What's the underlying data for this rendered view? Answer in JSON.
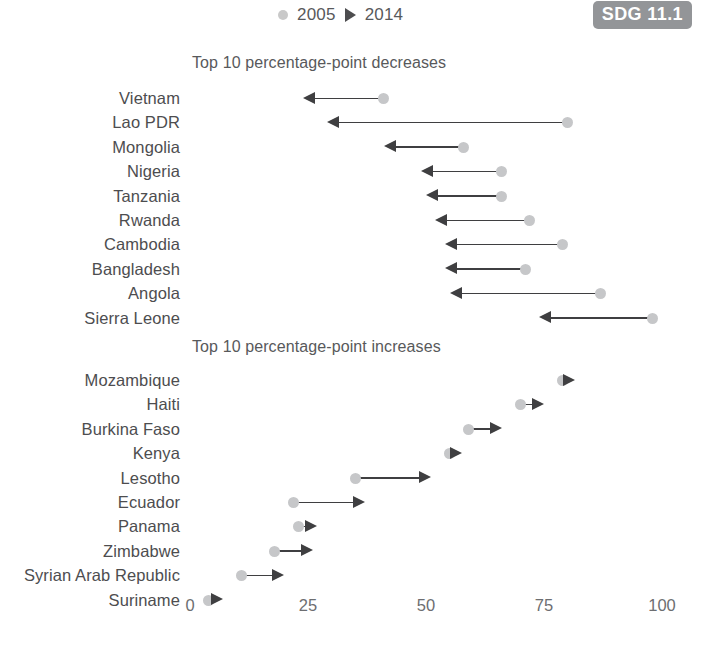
{
  "legend": {
    "items": [
      {
        "label": "2005",
        "marker": "circle-icon",
        "color": "#c9c9c9"
      },
      {
        "label": "2014",
        "marker": "triangle-right-icon",
        "color": "#4d4d4f"
      }
    ]
  },
  "badge": {
    "label": "SDG 11.1",
    "bg": "#939598",
    "fg": "#ffffff"
  },
  "axis": {
    "ticks": [
      0,
      25,
      50,
      75,
      100
    ],
    "min": 0,
    "max": 100,
    "pixel_min": 190,
    "pixel_max": 662
  },
  "chart_data": [
    {
      "type": "line",
      "title": "Top 10 percentage-point decreases",
      "xlabel": "",
      "ylabel": "",
      "xlim": [
        0,
        100
      ],
      "grid": false,
      "legend_position": "top",
      "direction": "decrease",
      "categories": [
        "Vietnam",
        "Lao PDR",
        "Mongolia",
        "Nigeria",
        "Tanzania",
        "Rwanda",
        "Cambodia",
        "Bangladesh",
        "Angola",
        "Sierra Leone"
      ],
      "series": [
        {
          "name": "2005",
          "values": [
            41,
            80,
            58,
            66,
            66,
            72,
            79,
            71,
            87,
            98
          ]
        },
        {
          "name": "2014",
          "values": [
            24,
            29,
            41,
            49,
            50,
            52,
            54,
            54,
            55,
            74
          ]
        }
      ]
    },
    {
      "type": "line",
      "title": "Top 10 percentage-point increases",
      "xlabel": "",
      "ylabel": "",
      "xlim": [
        0,
        100
      ],
      "grid": false,
      "legend_position": "top",
      "direction": "increase",
      "categories": [
        "Mozambique",
        "Haiti",
        "Burkina Faso",
        "Kenya",
        "Lesotho",
        "Ecuador",
        "Panama",
        "Zimbabwe",
        "Syrian Arab Republic",
        "Suriname"
      ],
      "series": [
        {
          "name": "2005",
          "values": [
            79,
            70,
            59,
            55,
            35,
            22,
            23,
            18,
            11,
            4
          ]
        },
        {
          "name": "2014",
          "values": [
            80,
            75,
            66,
            56,
            51,
            37,
            27,
            26,
            20,
            7
          ]
        }
      ]
    }
  ]
}
